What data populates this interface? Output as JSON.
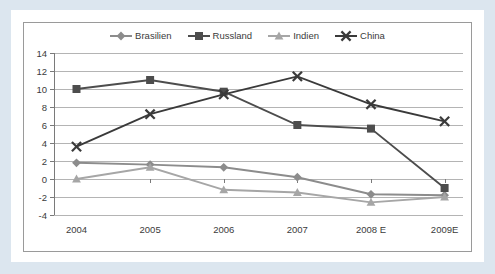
{
  "colors": {
    "page_border": "#dce6ef",
    "card_background": "#ffffff",
    "frame_border": "#9a9a9a",
    "gridline": "#b4b4b4",
    "axis": "#7a7a7a",
    "text": "#3b3b3b",
    "brasilien": "#8c8c8c",
    "russland": "#4d4d4d",
    "indien": "#a6a6a6",
    "china": "#3a3a3a"
  },
  "chart_data": {
    "type": "line",
    "title": "",
    "subtitle": "",
    "xlabel": "",
    "ylabel": "",
    "grid": true,
    "legend_position": "top",
    "categories": [
      "2004",
      "2005",
      "2006",
      "2007",
      "2008 E",
      "2009E"
    ],
    "yticks": [
      14,
      12,
      10,
      8,
      6,
      4,
      2,
      0,
      -2,
      -4
    ],
    "ylim": [
      -4,
      14
    ],
    "series": [
      {
        "name": "Brasilien",
        "marker": "diamond",
        "color": "#8c8c8c",
        "values": [
          1.8,
          1.6,
          1.3,
          0.2,
          -1.7,
          -1.8
        ]
      },
      {
        "name": "Russland",
        "marker": "square",
        "color": "#4d4d4d",
        "values": [
          10.0,
          11.0,
          9.7,
          6.0,
          5.6,
          -1.0
        ]
      },
      {
        "name": "Indien",
        "marker": "triangle",
        "color": "#a6a6a6",
        "values": [
          0.0,
          1.3,
          -1.2,
          -1.5,
          -2.6,
          -2.0
        ]
      },
      {
        "name": "China",
        "marker": "cross",
        "color": "#3a3a3a",
        "values": [
          3.6,
          7.2,
          9.4,
          11.4,
          8.3,
          6.4
        ]
      }
    ]
  },
  "legend": {
    "items": [
      {
        "label": "Brasilien"
      },
      {
        "label": "Russland"
      },
      {
        "label": "Indien"
      },
      {
        "label": "China"
      }
    ]
  }
}
